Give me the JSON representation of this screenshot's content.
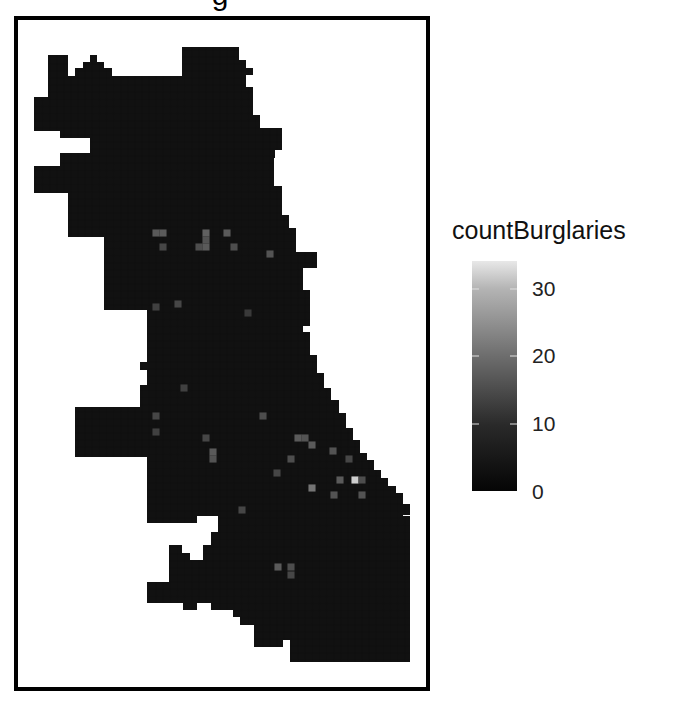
{
  "chart_data": {
    "type": "heatmap",
    "title_visible_fragment": "g",
    "xlabel": "",
    "ylabel": "",
    "grid": false,
    "legend_position": "right",
    "legend": {
      "title": "countBurglaries",
      "ticks": [
        0,
        10,
        20,
        30
      ],
      "range": [
        0,
        34
      ],
      "color_low": "#000000",
      "color_high": "#ededed"
    },
    "cell_size_px": 7.1,
    "highlighted_cells": [
      {
        "x": 156,
        "y": 233,
        "value": 12
      },
      {
        "x": 163,
        "y": 233,
        "value": 12
      },
      {
        "x": 206,
        "y": 233,
        "value": 13
      },
      {
        "x": 227,
        "y": 233,
        "value": 12
      },
      {
        "x": 206,
        "y": 240,
        "value": 11
      },
      {
        "x": 163,
        "y": 247,
        "value": 9
      },
      {
        "x": 199,
        "y": 247,
        "value": 10
      },
      {
        "x": 206,
        "y": 247,
        "value": 12
      },
      {
        "x": 234,
        "y": 247,
        "value": 10
      },
      {
        "x": 270,
        "y": 254,
        "value": 11
      },
      {
        "x": 178,
        "y": 304,
        "value": 9
      },
      {
        "x": 156,
        "y": 307,
        "value": 8
      },
      {
        "x": 248,
        "y": 313,
        "value": 7
      },
      {
        "x": 184,
        "y": 388,
        "value": 8
      },
      {
        "x": 156,
        "y": 416,
        "value": 9
      },
      {
        "x": 263,
        "y": 416,
        "value": 10
      },
      {
        "x": 156,
        "y": 432,
        "value": 8
      },
      {
        "x": 206,
        "y": 438,
        "value": 9
      },
      {
        "x": 298,
        "y": 438,
        "value": 12
      },
      {
        "x": 305,
        "y": 438,
        "value": 11
      },
      {
        "x": 312,
        "y": 445,
        "value": 12
      },
      {
        "x": 333,
        "y": 451,
        "value": 11
      },
      {
        "x": 291,
        "y": 459,
        "value": 10
      },
      {
        "x": 349,
        "y": 459,
        "value": 9
      },
      {
        "x": 213,
        "y": 452,
        "value": 12
      },
      {
        "x": 213,
        "y": 459,
        "value": 11
      },
      {
        "x": 277,
        "y": 473,
        "value": 9
      },
      {
        "x": 355,
        "y": 480,
        "value": 30
      },
      {
        "x": 340,
        "y": 480,
        "value": 12
      },
      {
        "x": 362,
        "y": 480,
        "value": 10
      },
      {
        "x": 312,
        "y": 488,
        "value": 16
      },
      {
        "x": 334,
        "y": 495,
        "value": 11
      },
      {
        "x": 362,
        "y": 495,
        "value": 11
      },
      {
        "x": 242,
        "y": 510,
        "value": 9
      },
      {
        "x": 278,
        "y": 567,
        "value": 12
      },
      {
        "x": 291,
        "y": 567,
        "value": 10
      },
      {
        "x": 291,
        "y": 575,
        "value": 9
      }
    ]
  },
  "legend": {
    "title": "countBurglaries",
    "labels": [
      "30",
      "20",
      "10",
      "0"
    ]
  },
  "title": {
    "text": "g"
  }
}
